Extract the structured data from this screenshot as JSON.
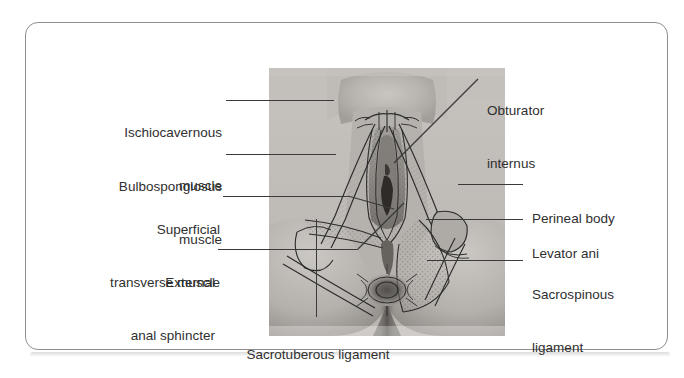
{
  "figure": {
    "kind": "anatomical-illustration",
    "frame_color": "#8e8e8e",
    "label_color": "#2f2f2f",
    "leader_color": "#3a3a3a",
    "background": "#ffffff"
  },
  "labels": {
    "left": [
      {
        "id": "ischiocavernous",
        "line1": "Ischiocavernous",
        "line2": "muscle"
      },
      {
        "id": "bulbospongiosus",
        "line1": "Bulbospongiosus",
        "line2": "muscle"
      },
      {
        "id": "superficial-transverse",
        "line1": "Superficial",
        "line2": "transverse muscle"
      },
      {
        "id": "external-anal-sphincter",
        "line1": "External",
        "line2": "anal sphincter"
      }
    ],
    "right": [
      {
        "id": "obturator-internus",
        "line1": "Obturator",
        "line2": "internus"
      },
      {
        "id": "perineal-body",
        "line1": "Perineal body",
        "line2": ""
      },
      {
        "id": "levator-ani",
        "line1": "Levator ani",
        "line2": ""
      },
      {
        "id": "sacrospinous-ligament",
        "line1": "Sacrospinous",
        "line2": "ligament"
      }
    ],
    "bottom": [
      {
        "id": "sacrotuberous-ligament",
        "line1": "Sacrotuberous ligament",
        "line2": ""
      }
    ]
  },
  "photo": {
    "alt": "Grayscale photograph of a female perineum overlaid with ink drawings of the perineal musculature",
    "tones": {
      "skin_light": "#cfcbc6",
      "skin_mid": "#b3afaa",
      "skin_dark": "#8d8883",
      "shadow": "#5e5a56",
      "ink": "#2b2b2b"
    }
  }
}
